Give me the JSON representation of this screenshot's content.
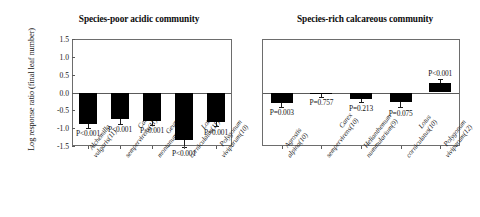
{
  "figure": {
    "ylabel": "Log response ratio (final leaf number)"
  },
  "chart_data": [
    {
      "type": "bar",
      "title": "Species-poor acidic community",
      "xlabel": "",
      "ylabel": "Log response ratio (final leaf number)",
      "ylim": [
        -1.5,
        1.5
      ],
      "yticks": [
        "1.5",
        "1.0",
        "0.5",
        "0.0",
        "-0.5",
        "-1.0",
        "-1.5"
      ],
      "ytick_values": [
        1.5,
        1.0,
        0.5,
        0.0,
        -0.5,
        -1.0,
        -1.5
      ],
      "grid": false,
      "legend": "none",
      "categories": [
        "Alchemilla vulgaris(11)",
        "Carex sempervirens(11)",
        "Geum montanum(12)",
        "Lotus corniculatus(11)",
        "Polygonum viviparum(10)"
      ],
      "category_lines": [
        [
          "Alchemilla",
          "vulgaris(11)"
        ],
        [
          "Carex",
          "sempervirens(11)"
        ],
        [
          "Geum",
          "montanum(12)"
        ],
        [
          "Lotus",
          "corniculatus(11)"
        ],
        [
          "Polygonum",
          "viviparum(10)"
        ]
      ],
      "values": [
        -0.87,
        -0.75,
        -0.8,
        -1.34,
        -0.83
      ],
      "errors": [
        0.12,
        0.12,
        0.11,
        0.19,
        0.12
      ],
      "annotations": [
        "P<0.001",
        "P<0.001",
        "P<0.001",
        "P<0.001",
        "P=0.001"
      ]
    },
    {
      "type": "bar",
      "title": "Species-rich calcareous community",
      "xlabel": "",
      "ylabel": "",
      "ylim": [
        -1.5,
        1.5
      ],
      "yticks": [],
      "ytick_values": [
        1.5,
        1.0,
        0.5,
        0.0,
        -0.5,
        -1.0,
        -1.5
      ],
      "grid": false,
      "legend": "none",
      "categories": [
        "Agrostis alpina(10)",
        "Carex sempervirens(10)",
        "Helianthemum nummularium(9)",
        "Lotus corniculatus(10)",
        "Polygonum viviparum(12)"
      ],
      "category_lines": [
        [
          "Agrostis",
          "alpina(10)"
        ],
        [
          "Carex",
          "sempervirens(10)"
        ],
        [
          "Helianthemum",
          "nummularium(9)"
        ],
        [
          "Lotus",
          "corniculatus(10)"
        ],
        [
          "Polygonum",
          "viviparum(12)"
        ]
      ],
      "values": [
        -0.3,
        -0.03,
        -0.17,
        -0.28,
        0.28
      ],
      "errors": [
        0.1,
        0.09,
        0.11,
        0.13,
        0.09
      ],
      "annotations": [
        "P=0.003",
        "P=0.757",
        "P=0.213",
        "P=0.075",
        "P<0.001"
      ]
    }
  ]
}
